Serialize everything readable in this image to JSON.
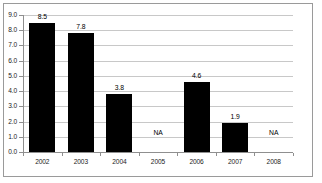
{
  "chart_data": {
    "type": "bar",
    "title": "",
    "subtitle": "",
    "xlabel": "",
    "ylabel": "",
    "categories": [
      "2002",
      "2003",
      "2004",
      "2005",
      "2006",
      "2007",
      "2008"
    ],
    "values": [
      8.5,
      7.8,
      3.8,
      null,
      4.6,
      1.9,
      null
    ],
    "point_labels": [
      "8.5",
      "7.8",
      "3.8",
      "NA",
      "4.6",
      "1.9",
      "NA"
    ],
    "missing_label": "NA",
    "ylim": [
      0.0,
      9.0
    ],
    "ytick_step": 1.0,
    "ytick_labels": [
      "9.0",
      "8.0",
      "7.0",
      "6.0",
      "5.0",
      "4.0",
      "3.0",
      "2.0",
      "1.0",
      "0.0"
    ],
    "ytick_values": [
      9.0,
      8.0,
      7.0,
      6.0,
      5.0,
      4.0,
      3.0,
      2.0,
      1.0,
      0.0
    ],
    "grid": true,
    "grid_axis": "y",
    "legend": false,
    "legend_position": "none",
    "bar_color": "#000000",
    "grid_color": "#c8c8c8",
    "axis_color": "#8f8f8f",
    "border_color": "#9a9a9a",
    "background_color": "#ffffff",
    "na_label_value": 1.15
  }
}
